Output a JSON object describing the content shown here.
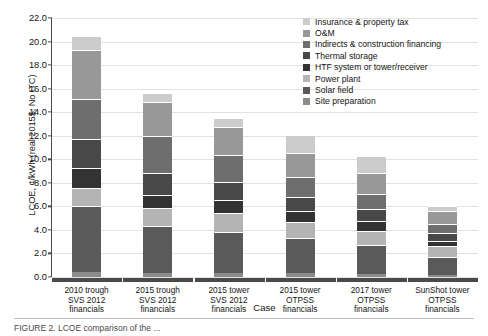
{
  "chart_data": {
    "type": "bar",
    "subtype": "stacked-bar",
    "title": "",
    "xlabel": "Case",
    "ylabel": "LCOE, ¢/kWh (real 2015$, No ITC)",
    "ylim": [
      0.0,
      22.0
    ],
    "ytick_step": 2.0,
    "yticks": [
      "22.0",
      "20.0",
      "18.0",
      "16.0",
      "14.0",
      "12.0",
      "10.0",
      "8.0",
      "6.0",
      "4.0",
      "2.0",
      "0.0"
    ],
    "grid": true,
    "grid_axis": "y",
    "legend_position": "top-right",
    "categories": [
      "2010 trough\nSVS 2012\nfinancials",
      "2015 trough\nSVS 2012\nfinancials",
      "2015 tower\nSVS 2012\nfinancials",
      "2015 tower\nOTPSS\nfinancials",
      "2017 tower\nOTPSS\nfinancials",
      "SunShot tower\nOTPSS\nfinancials"
    ],
    "category_lines": [
      [
        "2010 trough",
        "SVS 2012",
        "financials"
      ],
      [
        "2015 trough",
        "SVS 2012",
        "financials"
      ],
      [
        "2015 tower",
        "SVS 2012",
        "financials"
      ],
      [
        "2015 tower",
        "OTPSS",
        "financials"
      ],
      [
        "2017 tower",
        "OTPSS",
        "financials"
      ],
      [
        "SunShot tower",
        "OTPSS",
        "financials"
      ]
    ],
    "series": [
      {
        "name": "Site preparation",
        "color": "#8c8c8c",
        "values": [
          0.4,
          0.35,
          0.35,
          0.3,
          0.25,
          0.2
        ]
      },
      {
        "name": "Solar field",
        "color": "#5a5a5a",
        "values": [
          5.6,
          4.0,
          3.5,
          3.0,
          2.5,
          1.5
        ]
      },
      {
        "name": "Power plant",
        "color": "#b4b4b4",
        "values": [
          1.6,
          1.5,
          1.6,
          1.4,
          1.2,
          0.9
        ]
      },
      {
        "name": "HTF system or tower/receiver",
        "color": "#333333",
        "values": [
          1.7,
          1.1,
          1.1,
          0.9,
          0.8,
          0.5
        ]
      },
      {
        "name": "Thermal storage",
        "color": "#484848",
        "values": [
          2.4,
          1.9,
          1.5,
          1.2,
          1.0,
          0.6
        ]
      },
      {
        "name": "Indirects & construction financing",
        "color": "#6e6e6e",
        "values": [
          3.4,
          3.1,
          2.3,
          1.7,
          1.3,
          0.8
        ]
      },
      {
        "name": "O&M",
        "color": "#989898",
        "values": [
          4.2,
          2.9,
          2.4,
          2.0,
          1.8,
          1.1
        ]
      },
      {
        "name": "Insurance & property tax",
        "color": "#cccccc",
        "values": [
          1.2,
          0.75,
          0.75,
          1.6,
          1.4,
          0.4
        ]
      }
    ],
    "totals": [
      20.5,
      15.6,
      13.5,
      12.1,
      10.25,
      6.0
    ],
    "legend_order_top_to_bottom": [
      "Insurance & property tax",
      "O&M",
      "Indirects & construction financing",
      "Thermal storage",
      "HTF system or tower/receiver",
      "Power plant",
      "Solar field",
      "Site preparation"
    ]
  },
  "caption": "FIGURE 2. LCOE comparison of the ..."
}
